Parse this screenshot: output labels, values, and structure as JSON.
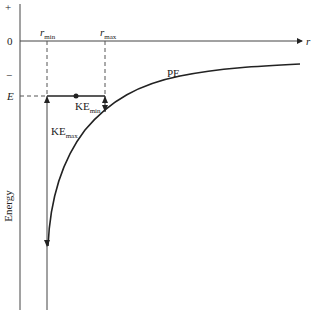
{
  "diagram": {
    "y_axis": {
      "plus_label": "+",
      "zero_label": "0",
      "minus_label": "−",
      "energy_level_label": "E",
      "title": "Energy"
    },
    "x_axis": {
      "label": "r"
    },
    "markers": {
      "r_min": "r",
      "r_min_sub": "min",
      "r_max": "r",
      "r_max_sub": "max"
    },
    "curve_label": "PE",
    "ke_min": {
      "text": "KE",
      "sub": "min"
    },
    "ke_max": {
      "text": "KE",
      "sub": "max"
    },
    "colors": {
      "ink": "#222222",
      "dashed": "#555555"
    }
  }
}
